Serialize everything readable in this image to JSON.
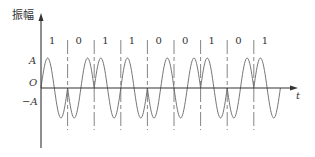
{
  "diagram": {
    "type": "2PSK waveform",
    "y_axis_label": "振幅",
    "x_axis_label": "t",
    "origin_label": "O",
    "amplitude_label": "A",
    "neg_amplitude_label": "−A",
    "bits": [
      "1",
      "0",
      "1",
      "1",
      "0",
      "0",
      "1",
      "0",
      "1"
    ],
    "colors": {
      "line": "#555555",
      "axis": "#333333",
      "text": "#333333"
    }
  }
}
